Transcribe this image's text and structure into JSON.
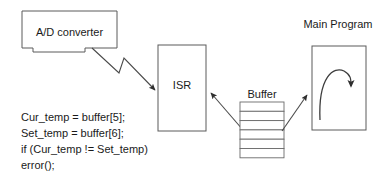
{
  "diagram": {
    "title": "",
    "background_color": "#ffffff",
    "stroke_color": "#5a5a5a",
    "text_color": "#1a1a1a",
    "nodes": {
      "adc": {
        "label": "A/D converter",
        "shape": "notched-rectangle"
      },
      "isr": {
        "label": "ISR",
        "shape": "rectangle"
      },
      "buffer": {
        "label": "Buffer",
        "shape": "stacked-cells",
        "cell_count": 6
      },
      "main_program": {
        "label": "Main Program",
        "shape": "rectangle",
        "inner_icon": "loop-arrow"
      }
    },
    "connectors": {
      "adc_to_isr": {
        "style": "lightning-bolt-arrow",
        "from": "adc",
        "to": "isr"
      },
      "buffer_to_isr": {
        "style": "straight-arrow",
        "from": "buffer",
        "to": "isr"
      },
      "buffer_to_main": {
        "style": "straight-arrow",
        "from": "buffer",
        "to": "main_program"
      }
    },
    "code_block": {
      "lines": [
        "Cur_temp = buffer[5];",
        "Set_temp = buffer[6];",
        "if (Cur_temp != Set_temp)",
        "        error();"
      ]
    }
  }
}
